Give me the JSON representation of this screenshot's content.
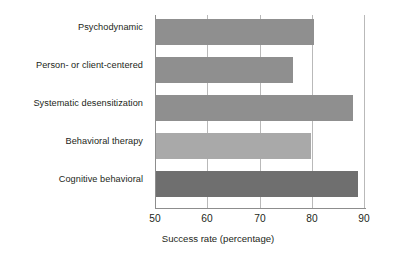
{
  "chart_data": {
    "type": "bar",
    "orientation": "horizontal",
    "title": "",
    "xlabel": "Success rate (percentage)",
    "ylabel": "",
    "xlim": [
      50,
      90
    ],
    "xticks": [
      50,
      60,
      70,
      80,
      90
    ],
    "xtick_labels": [
      "50",
      "60",
      "70",
      "80",
      "90"
    ],
    "grid": true,
    "grid_axis": "x",
    "legend": false,
    "categories": [
      "Psychodynamic",
      "Person- or client-centered",
      "Systematic desensitization",
      "Behavioral therapy",
      "Cognitive behavioral"
    ],
    "values": [
      80,
      76,
      87.5,
      79.5,
      88.5
    ],
    "bar_colors": [
      "#8f8f8f",
      "#8f8f8f",
      "#8f8f8f",
      "#a9a9a9",
      "#6f6f6f"
    ],
    "background_color": "#ffffff",
    "grid_color": "#b9b9b9",
    "axis_color": "#8d8d8d",
    "text_color": "#231f20"
  },
  "axis": {
    "x_title": "Success rate (percentage)"
  }
}
